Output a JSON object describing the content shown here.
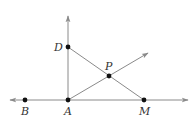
{
  "diagram": {
    "colors": {
      "line": "#8a8a8a",
      "point": "#111111",
      "label": "#333333"
    },
    "points": {
      "A": {
        "label": "A",
        "x": 68,
        "y": 100
      },
      "B": {
        "label": "B",
        "x": 25,
        "y": 100
      },
      "D": {
        "label": "D",
        "x": 68,
        "y": 47
      },
      "M": {
        "label": "M",
        "x": 144,
        "y": 100
      },
      "P": {
        "label": "P",
        "x": 109,
        "y": 76
      }
    },
    "lines": [
      {
        "name": "line-BM",
        "type": "line",
        "through": [
          "B",
          "A",
          "M"
        ]
      },
      {
        "name": "ray-AD",
        "type": "ray",
        "from": "A",
        "through": "D"
      },
      {
        "name": "ray-AP",
        "type": "ray",
        "from": "A",
        "through": "P"
      },
      {
        "name": "segment-DM",
        "type": "segment",
        "from": "D",
        "to": "M"
      }
    ]
  }
}
